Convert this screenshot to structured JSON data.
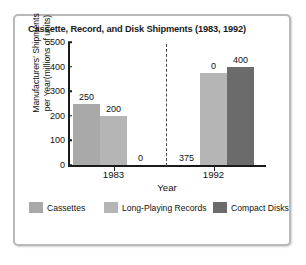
{
  "chart_data": {
    "type": "bar",
    "title": "Cassette, Record, and Disk Shipments (1983, 1992)",
    "xlabel": "Year",
    "ylabel": "Manufacturers' Shipments per Year(millions of units)",
    "ylabel_line1": "Manufacturers' Shipments",
    "ylabel_line2": "per Year(millions of units)",
    "categories": [
      "1983",
      "1992"
    ],
    "series": [
      {
        "name": "Cassettes",
        "values": [
          250,
          0
        ],
        "color": "#a9a9a9"
      },
      {
        "name": "Long-Playing Records",
        "values": [
          200,
          375
        ],
        "color": "#b5b5b5"
      },
      {
        "name": "Compact Disks",
        "values": [
          0,
          400
        ],
        "color": "#6b6b6b"
      }
    ],
    "ylim": [
      0,
      500
    ],
    "yticks": [
      500,
      400,
      300,
      200,
      100,
      0
    ],
    "ytick_labels": [
      "500",
      "400",
      "300",
      "200",
      "100",
      "0"
    ],
    "bar_labels": [
      {
        "text": "250"
      },
      {
        "text": "200"
      },
      {
        "text": "0"
      },
      {
        "text": "375"
      },
      {
        "text": "0"
      },
      {
        "text": "400"
      }
    ],
    "grid": false,
    "legend_position": "bottom",
    "group_divider": true
  },
  "legend": {
    "items": [
      {
        "label": "Cassettes",
        "color": "#a9a9a9"
      },
      {
        "label": "Long-Playing Records",
        "color": "#b5b5b5"
      },
      {
        "label": "Compact Disks",
        "color": "#6b6b6b"
      }
    ]
  }
}
